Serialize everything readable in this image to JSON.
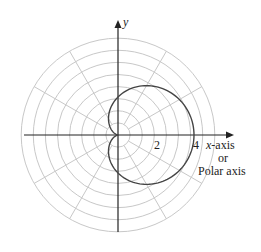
{
  "chart_data": {
    "type": "line",
    "title": "",
    "equation": "r = 2 + 2cos(theta)",
    "x_axis_label": "x-axis",
    "x_axis_label_or": "or",
    "x_axis_label_alt": "Polar axis",
    "y_axis_label": "y",
    "tick_labels": [
      "2",
      "4"
    ],
    "tick_values": [
      2,
      4
    ],
    "grid": {
      "type": "polar",
      "rings": 8,
      "spokes_deg": [
        30,
        60,
        120,
        150,
        210,
        240,
        300,
        330
      ]
    },
    "key_points": [
      {
        "x": 4,
        "y": 0
      },
      {
        "x": 0,
        "y": 0
      },
      {
        "x": 0,
        "y": 2
      },
      {
        "x": 0,
        "y": -2
      }
    ]
  },
  "labels": {
    "y": "y",
    "tick2": "2",
    "tick4": "4",
    "xaxis": "x-axis",
    "or": "or",
    "polar": "Polar axis"
  },
  "colors": {
    "grid": "#c8c8c8",
    "axis": "#222222",
    "curve": "#444444"
  }
}
